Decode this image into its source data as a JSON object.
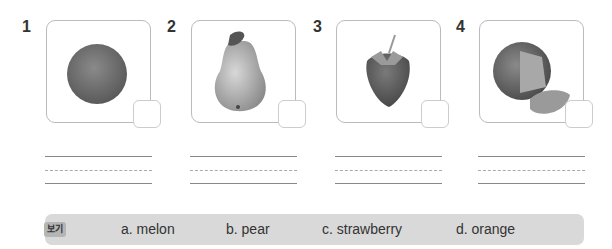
{
  "items": [
    {
      "number": "1",
      "image": "orange-image",
      "answer": ""
    },
    {
      "number": "2",
      "image": "pear-image",
      "answer": ""
    },
    {
      "number": "3",
      "image": "strawberry-image",
      "answer": ""
    },
    {
      "number": "4",
      "image": "melon-image",
      "answer": ""
    }
  ],
  "word_bank": {
    "label": "보기",
    "options": [
      "a. melon",
      "b. pear",
      "c. strawberry",
      "d. orange"
    ]
  }
}
